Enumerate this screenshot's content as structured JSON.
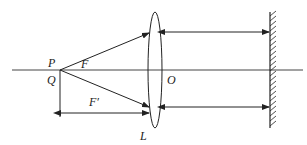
{
  "diagram": {
    "type": "optics-lens-mirror",
    "labels": {
      "P": "P",
      "Q": "Q",
      "F": "F",
      "F_prime": "F′",
      "O": "O",
      "L": "L"
    },
    "colors": {
      "stroke": "#222222",
      "background": "#ffffff"
    }
  }
}
